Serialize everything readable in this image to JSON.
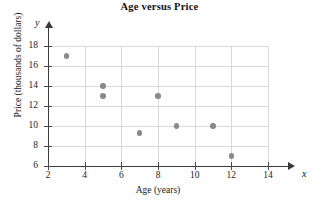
{
  "chart_data": {
    "type": "scatter",
    "title": "Age versus Price",
    "xlabel": "Age (years)",
    "ylabel": "Price (thousands of dollars)",
    "axis_letter_x": "x",
    "axis_letter_y": "y",
    "xlim": [
      2,
      14
    ],
    "ylim": [
      6,
      18
    ],
    "xticks": [
      2,
      4,
      6,
      8,
      10,
      12,
      14
    ],
    "yticks": [
      6,
      8,
      10,
      12,
      14,
      16,
      18
    ],
    "xtick_labels": [
      "2",
      "4",
      "6",
      "8",
      "10",
      "12",
      "14"
    ],
    "ytick_labels": [
      "6",
      "8",
      "10",
      "12",
      "14",
      "16",
      "18"
    ],
    "grid": true,
    "legend": false,
    "point_color": "#8a8a8a",
    "axis_color": "#3a3a3a",
    "grid_color": "#d8d8d8",
    "points": [
      {
        "x": 3,
        "y": 17
      },
      {
        "x": 5,
        "y": 14
      },
      {
        "x": 5,
        "y": 13
      },
      {
        "x": 7,
        "y": 9.3
      },
      {
        "x": 8,
        "y": 13
      },
      {
        "x": 9,
        "y": 10
      },
      {
        "x": 11,
        "y": 10
      },
      {
        "x": 12,
        "y": 7
      }
    ]
  }
}
